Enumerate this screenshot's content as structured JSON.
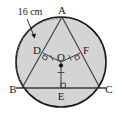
{
  "figure": {
    "type": "geometry-diagram",
    "background_color": "#ffffff",
    "circle_fill_color": "#d4d4d4",
    "stroke_color": "#1a1a1a",
    "dotted_arc_color": "#6e6e6e",
    "circle": {
      "center_label": "O",
      "center_x": 61,
      "center_y": 62,
      "radius": 45
    },
    "points": [
      {
        "label": "A",
        "x": 62,
        "y": 17,
        "label_x": 62,
        "label_y": 13,
        "role": "apex-on-circle"
      },
      {
        "label": "B",
        "x": 22,
        "y": 88,
        "label_x": 15,
        "label_y": 93,
        "role": "left-vertex-on-circle"
      },
      {
        "label": "C",
        "x": 100,
        "y": 88,
        "label_x": 107,
        "label_y": 93,
        "role": "right-vertex-on-circle"
      },
      {
        "label": "D",
        "x": 43,
        "y": 53,
        "label_x": 37,
        "label_y": 51,
        "role": "midpoint-of-AB"
      },
      {
        "label": "F",
        "x": 80,
        "y": 53,
        "label_x": 84,
        "label_y": 51,
        "role": "midpoint-of-AC"
      },
      {
        "label": "E",
        "x": 61,
        "y": 88,
        "label_x": 61,
        "label_y": 100,
        "role": "midpoint-of-BC"
      },
      {
        "label": "O",
        "x": 61,
        "y": 62,
        "label_x": 62,
        "label_y": 60,
        "role": "circle-center"
      }
    ],
    "dimension": {
      "label": "16 cm",
      "label_x": 30,
      "label_y": 13,
      "points_to": "arc-AB",
      "arrow_tip_x": 34,
      "arrow_tip_y": 38
    },
    "right_angle_marks": [
      {
        "at": "D",
        "on": "OD-perpendicular-to-AB"
      },
      {
        "at": "F",
        "on": "OF-perpendicular-to-AC"
      },
      {
        "at": "E",
        "on": "OE-perpendicular-to-BC"
      }
    ],
    "tick_marks": [
      {
        "on": "OD",
        "count": 1
      },
      {
        "on": "OF",
        "count": 1
      },
      {
        "on": "OE",
        "count": 1
      }
    ],
    "segments": [
      {
        "from": "A",
        "to": "B",
        "style": "solid"
      },
      {
        "from": "A",
        "to": "C",
        "style": "solid"
      },
      {
        "from": "B",
        "to": "C",
        "style": "solid"
      },
      {
        "from": "O",
        "to": "D",
        "style": "solid"
      },
      {
        "from": "O",
        "to": "F",
        "style": "solid"
      },
      {
        "from": "O",
        "to": "E",
        "style": "solid"
      },
      {
        "from": "A",
        "to": "B",
        "style": "dotted-arc"
      }
    ]
  }
}
